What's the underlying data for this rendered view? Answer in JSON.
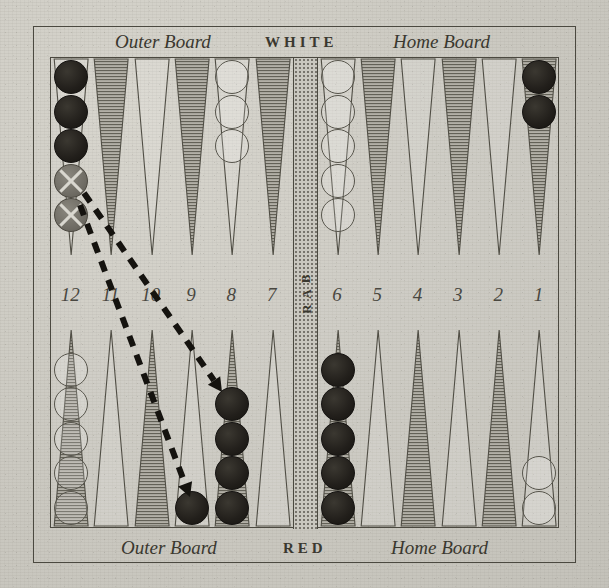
{
  "figure": {
    "kind": "backgammon-board-diagram",
    "top_labels": {
      "outer_board": "Outer Board",
      "player": "WHITE",
      "home_board": "Home Board"
    },
    "bottom_labels": {
      "outer_board": "Outer Board",
      "player": "RED",
      "home_board": "Home Board"
    },
    "bar_label": [
      "B",
      "A",
      "R"
    ],
    "point_numbers": [
      "12",
      "11",
      "10",
      "9",
      "8",
      "7",
      "6",
      "5",
      "4",
      "3",
      "2",
      "1"
    ],
    "colors": {
      "paper": "#cbc9c1",
      "ink": "#3a382f",
      "point_dark": "#b3b0a7",
      "checker_black": "#221f1b",
      "checker_white": "#e9e7df",
      "checker_marked": "#6e6b63",
      "bar": "#c9c7bf"
    },
    "top_points": [
      {
        "number": "12",
        "shade": "light",
        "checkers": [
          {
            "color": "black",
            "marked": false
          },
          {
            "color": "black",
            "marked": false
          },
          {
            "color": "black",
            "marked": false
          },
          {
            "color": "marked",
            "marked": true
          },
          {
            "color": "marked",
            "marked": true
          }
        ]
      },
      {
        "number": "11",
        "shade": "dark",
        "checkers": []
      },
      {
        "number": "10",
        "shade": "light",
        "checkers": []
      },
      {
        "number": "9",
        "shade": "dark",
        "checkers": []
      },
      {
        "number": "8",
        "shade": "light",
        "checkers": [
          {
            "color": "white",
            "marked": false
          },
          {
            "color": "white",
            "marked": false
          },
          {
            "color": "white",
            "marked": false
          }
        ]
      },
      {
        "number": "7",
        "shade": "dark",
        "checkers": []
      },
      {
        "number": "6",
        "shade": "light",
        "checkers": [
          {
            "color": "white",
            "marked": false
          },
          {
            "color": "white",
            "marked": false
          },
          {
            "color": "white",
            "marked": false
          },
          {
            "color": "white",
            "marked": false
          },
          {
            "color": "white",
            "marked": false
          }
        ]
      },
      {
        "number": "5",
        "shade": "dark",
        "checkers": []
      },
      {
        "number": "4",
        "shade": "light",
        "checkers": []
      },
      {
        "number": "3",
        "shade": "dark",
        "checkers": []
      },
      {
        "number": "2",
        "shade": "light",
        "checkers": []
      },
      {
        "number": "1",
        "shade": "dark",
        "checkers": [
          {
            "color": "black",
            "marked": false
          },
          {
            "color": "black",
            "marked": false
          }
        ]
      }
    ],
    "bottom_points": [
      {
        "number": "12",
        "shade": "dark",
        "checkers": [
          {
            "color": "white",
            "marked": false
          },
          {
            "color": "white",
            "marked": false
          },
          {
            "color": "white",
            "marked": false
          },
          {
            "color": "white",
            "marked": false
          },
          {
            "color": "white",
            "marked": false
          }
        ]
      },
      {
        "number": "11",
        "shade": "light",
        "checkers": []
      },
      {
        "number": "10",
        "shade": "dark",
        "checkers": []
      },
      {
        "number": "9",
        "shade": "light",
        "checkers": [
          {
            "color": "black",
            "marked": false
          }
        ]
      },
      {
        "number": "8",
        "shade": "dark",
        "checkers": [
          {
            "color": "black",
            "marked": false
          },
          {
            "color": "black",
            "marked": false
          },
          {
            "color": "black",
            "marked": false
          },
          {
            "color": "black",
            "marked": false
          }
        ]
      },
      {
        "number": "7",
        "shade": "light",
        "checkers": []
      },
      {
        "number": "6",
        "shade": "dark",
        "checkers": [
          {
            "color": "black",
            "marked": false
          },
          {
            "color": "black",
            "marked": false
          },
          {
            "color": "black",
            "marked": false
          },
          {
            "color": "black",
            "marked": false
          },
          {
            "color": "black",
            "marked": false
          }
        ]
      },
      {
        "number": "5",
        "shade": "light",
        "checkers": []
      },
      {
        "number": "4",
        "shade": "dark",
        "checkers": []
      },
      {
        "number": "3",
        "shade": "light",
        "checkers": []
      },
      {
        "number": "2",
        "shade": "dark",
        "checkers": []
      },
      {
        "number": "1",
        "shade": "light",
        "checkers": [
          {
            "color": "white",
            "marked": false
          },
          {
            "color": "white",
            "marked": false
          }
        ]
      }
    ],
    "move_arrows": [
      {
        "from": "top-12",
        "to": "bottom-8",
        "x1": 84,
        "y1": 193,
        "x2": 222,
        "y2": 392
      },
      {
        "from": "top-12",
        "to": "bottom-9",
        "x1": 80,
        "y1": 205,
        "x2": 190,
        "y2": 497
      }
    ]
  }
}
